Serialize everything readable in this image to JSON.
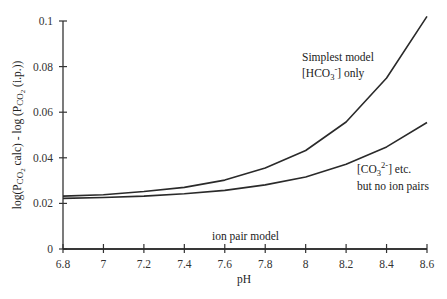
{
  "chart_data": {
    "type": "line",
    "title": "",
    "xlabel": "pH",
    "ylabel": "log(PCO2 calc) - log (PCO2 (i.p.))",
    "xlim": [
      6.8,
      8.6
    ],
    "ylim": [
      0,
      0.1
    ],
    "grid": false,
    "legend": "inline annotations",
    "x": [
      6.8,
      7.0,
      7.2,
      7.4,
      7.6,
      7.8,
      8.0,
      8.2,
      8.4,
      8.6
    ],
    "x_tick_labels": [
      "6.8",
      "7",
      "7.2",
      "7.4",
      "7.6",
      "7.8",
      "8",
      "8.2",
      "8.4",
      "8.6"
    ],
    "y_ticks": [
      0,
      0.02,
      0.04,
      0.06,
      0.08,
      0.1
    ],
    "y_tick_labels": [
      "0",
      "0.02",
      "0.04",
      "0.06",
      "0.08",
      "0.1"
    ],
    "series": [
      {
        "name": "Simplest model [HCO3-] only",
        "values": [
          0.0232,
          0.0238,
          0.0252,
          0.027,
          0.0302,
          0.0355,
          0.0432,
          0.0557,
          0.075,
          0.102
        ]
      },
      {
        "name": "[CO3 2-] etc. but no ion pairs",
        "values": [
          0.0222,
          0.0226,
          0.0232,
          0.0242,
          0.0257,
          0.0281,
          0.0316,
          0.0372,
          0.0448,
          0.0555
        ]
      },
      {
        "name": "ion pair model",
        "values": [
          0,
          0,
          0,
          0,
          0,
          0,
          0,
          0,
          0,
          0
        ]
      }
    ],
    "annotations": [
      {
        "text_lines": [
          "Simplest model",
          "[HCO3-] only"
        ],
        "x": 8.1,
        "y": 0.085
      },
      {
        "text_lines": [
          "[CO3 2-] etc.",
          "but no ion pairs"
        ],
        "x": 8.25,
        "y": 0.03
      },
      {
        "text_lines": [
          "ion pair model"
        ],
        "x": 7.65,
        "y": 0.003
      }
    ]
  },
  "labels": {
    "xlabel": "pH",
    "ylabel_parts": {
      "a": "log(P",
      "a_sub": "CO",
      "a_sub2": "2",
      "b": " calc) - log (P",
      "b_sub": "CO",
      "b_sub2": "2",
      "c": " (i.p.))"
    },
    "annot1_line1": "Simplest model",
    "annot1_line2_pre": "[HCO",
    "annot1_line2_sub": "3",
    "annot1_line2_sup": "-",
    "annot1_line2_post": "] only",
    "annot2_line1_pre": "[CO",
    "annot2_line1_sub": "3",
    "annot2_line1_sup": "2-",
    "annot2_line1_post": "] etc.",
    "annot2_line2": "but no ion pairs",
    "annot3": "ion pair model"
  },
  "style": {
    "line_color": "#2a2a2a",
    "axis_color": "#333333"
  }
}
